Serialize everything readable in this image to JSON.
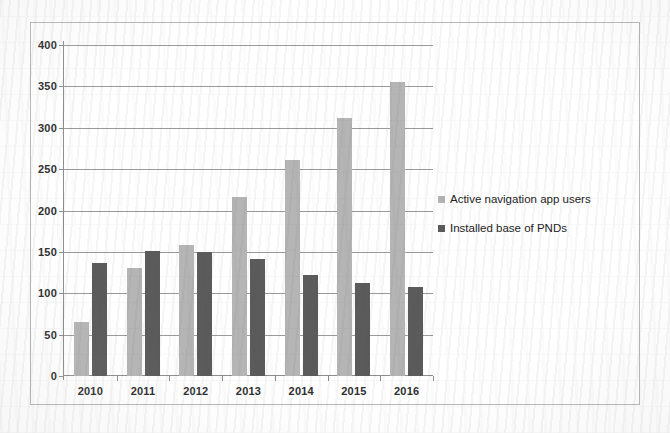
{
  "chart_data": {
    "type": "bar",
    "title": "",
    "xlabel": "",
    "ylabel": "",
    "categories": [
      "2010",
      "2011",
      "2012",
      "2013",
      "2014",
      "2015",
      "2016"
    ],
    "series": [
      {
        "name": "Active navigation app users",
        "color": "#b5b5b5",
        "values": [
          65,
          130,
          158,
          216,
          261,
          312,
          355
        ]
      },
      {
        "name": "Installed base of PNDs",
        "color": "#5b5b5b",
        "values": [
          136,
          151,
          150,
          141,
          122,
          113,
          108
        ]
      }
    ],
    "ylim": [
      0,
      400
    ],
    "yticks": [
      0,
      50,
      100,
      150,
      200,
      250,
      300,
      350,
      400
    ],
    "ytick_labels": [
      "0",
      "50",
      "100",
      "150",
      "200",
      "250",
      "300",
      "350",
      "400"
    ],
    "grid": "horizontal",
    "legend_position": "right"
  }
}
